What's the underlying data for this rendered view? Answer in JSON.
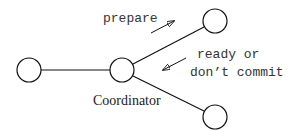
{
  "diagram": {
    "nodes": [
      {
        "id": "participant-left",
        "cx": 29,
        "cy": 70
      },
      {
        "id": "coordinator",
        "cx": 122,
        "cy": 70,
        "label": "Coordinator"
      },
      {
        "id": "participant-top",
        "cx": 215,
        "cy": 21
      },
      {
        "id": "participant-bottom",
        "cx": 215,
        "cy": 117
      }
    ],
    "messages": {
      "prepare": "prepare",
      "reply_line1": "ready or",
      "reply_line2": "don’t commit"
    },
    "coordinator_label": "Coordinator",
    "colors": {
      "stroke": "#111111",
      "text": "#333333",
      "background": "#ffffff"
    }
  }
}
